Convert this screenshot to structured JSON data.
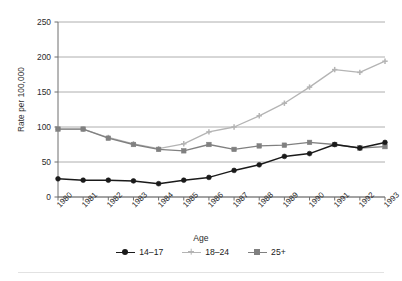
{
  "chart_data": {
    "type": "line",
    "title": "",
    "xlabel": "Age",
    "ylabel": "Rate per 100,000",
    "categories": [
      "1980",
      "1981",
      "1982",
      "1983",
      "1984",
      "1985",
      "1986",
      "1987",
      "1988",
      "1989",
      "1990",
      "1991",
      "1992",
      "1993"
    ],
    "ylim": [
      0,
      250
    ],
    "yticks": [
      0,
      50,
      100,
      150,
      200,
      250
    ],
    "ytick_labels": [
      "0",
      "50",
      "100",
      "150",
      "200",
      "250"
    ],
    "grid": "horizontal",
    "legend_position": "bottom-center",
    "series": [
      {
        "name": "14–17",
        "color": "#1a1a1a",
        "marker": "circle",
        "values": [
          26,
          24,
          24,
          23,
          19,
          24,
          28,
          38,
          46,
          58,
          62,
          75,
          70,
          78
        ]
      },
      {
        "name": "18–24",
        "color": "#b4b4b4",
        "marker": "cross",
        "values": [
          97,
          97,
          85,
          76,
          69,
          76,
          93,
          100,
          116,
          134,
          157,
          182,
          178,
          194
        ]
      },
      {
        "name": "25+",
        "color": "#808080",
        "marker": "square",
        "values": [
          97,
          97,
          84,
          75,
          68,
          66,
          75,
          68,
          73,
          74,
          78,
          75,
          70,
          72
        ]
      }
    ]
  },
  "legend": {
    "items": [
      {
        "label": "14–17"
      },
      {
        "label": "18–24"
      },
      {
        "label": "25+"
      }
    ]
  },
  "axis": {
    "x_title": "Age",
    "y_title": "Rate per 100,000"
  }
}
